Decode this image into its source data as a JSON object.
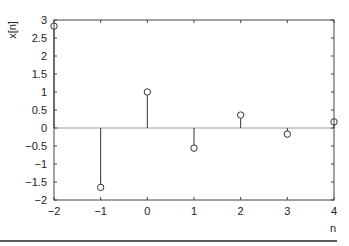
{
  "chart_data": {
    "type": "stem",
    "title": "",
    "xlabel": "n",
    "ylabel": "x[n]",
    "x": [
      -2,
      -1,
      0,
      1,
      2,
      3,
      4
    ],
    "values": [
      2.83,
      -1.65,
      1.0,
      -0.56,
      0.36,
      -0.17,
      0.17
    ],
    "xlim": [
      -2,
      4
    ],
    "ylim": [
      -2,
      3
    ],
    "xticks": [
      -2,
      -1,
      0,
      1,
      2,
      3,
      4
    ],
    "xtick_labels": [
      "−2",
      "−1",
      "0",
      "1",
      "2",
      "3",
      "4"
    ],
    "yticks": [
      3,
      2.5,
      2,
      1.5,
      1,
      0.5,
      0,
      -0.5,
      -1,
      -1.5,
      -2
    ],
    "ytick_labels": [
      "3",
      "2.5",
      "2",
      "1.5",
      "1",
      "0.5",
      "0",
      "−0.5",
      "−1",
      "−1.5",
      "−2"
    ],
    "grid": false,
    "legend": null,
    "zero_line": true,
    "marker": "open-circle",
    "colors": {
      "stem": "#333333",
      "axis": "#444444",
      "zero_line": "#999999",
      "rule": "#222222"
    }
  }
}
